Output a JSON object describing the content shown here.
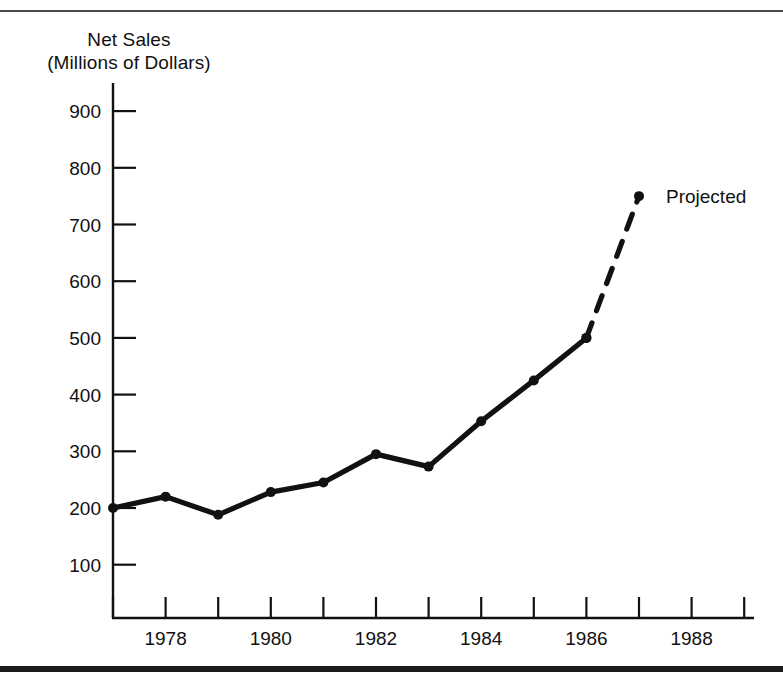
{
  "figure": {
    "title_line1": "Net Sales",
    "title_line2": "(Millions of Dollars)",
    "series_annotation": "Projected"
  },
  "chart_data": {
    "type": "line",
    "title": "Net Sales (Millions of Dollars)",
    "xlabel": "",
    "ylabel": "Net Sales (Millions of Dollars)",
    "xlim": [
      1977,
      1989
    ],
    "ylim": [
      0,
      950
    ],
    "grid": false,
    "legend_position": "none",
    "y_ticks": [
      100,
      200,
      300,
      400,
      500,
      600,
      700,
      800,
      900
    ],
    "y_tick_labels": [
      "100",
      "200",
      "300",
      "400",
      "500",
      "600",
      "700",
      "800",
      "900"
    ],
    "x_ticks": [
      1977,
      1978,
      1979,
      1980,
      1981,
      1982,
      1983,
      1984,
      1985,
      1986,
      1987,
      1988,
      1989
    ],
    "x_tick_labels": [
      "",
      "1978",
      "",
      "1980",
      "",
      "1982",
      "",
      "1984",
      "",
      "1986",
      "",
      "1988",
      ""
    ],
    "series": [
      {
        "name": "Net Sales (actual)",
        "style": "solid",
        "color": "#111111",
        "markers": true,
        "x": [
          1977,
          1978,
          1979,
          1980,
          1981,
          1982,
          1983,
          1984,
          1985,
          1986
        ],
        "values": [
          200,
          220,
          188,
          228,
          245,
          295,
          273,
          353,
          425,
          500
        ]
      },
      {
        "name": "Projected",
        "style": "dashed",
        "color": "#111111",
        "markers": true,
        "x": [
          1986,
          1987
        ],
        "values": [
          500,
          750
        ]
      }
    ],
    "annotations": [
      {
        "text": "Projected",
        "x": 1987,
        "y": 750,
        "position": "right"
      }
    ]
  }
}
